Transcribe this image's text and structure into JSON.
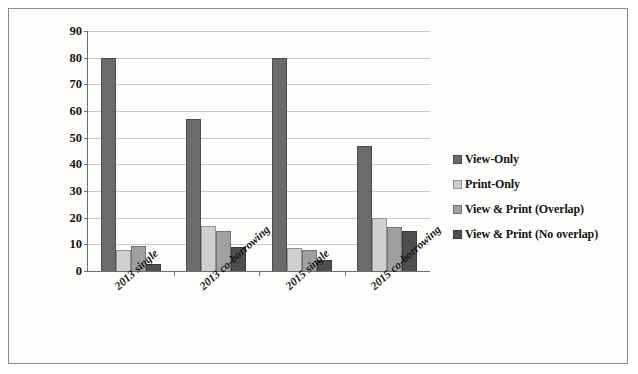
{
  "chart_data": {
    "type": "bar",
    "title": "",
    "xlabel": "",
    "ylabel": "Percentage of activity by loan type",
    "ylim": [
      0,
      90
    ],
    "ytick_step": 10,
    "yticks": [
      "90",
      "80",
      "70",
      "60",
      "50",
      "40",
      "30",
      "20",
      "10",
      "0"
    ],
    "grid": true,
    "legend_position": "right",
    "categories": [
      "2013 single",
      "2013 co-borrowing",
      "2015 single",
      "2015 co-borrowing"
    ],
    "series": [
      {
        "name": "View-Only",
        "color": "#6b6b6b",
        "values": [
          80,
          57,
          80,
          47
        ]
      },
      {
        "name": "Print-Only",
        "color": "#cfcfcf",
        "values": [
          8,
          17,
          8.5,
          20
        ]
      },
      {
        "name": "View & Print (Overlap)",
        "color": "#a0a0a0",
        "values": [
          9.5,
          15,
          8,
          16.5
        ]
      },
      {
        "name": "View & Print (No overlap)",
        "color": "#4f4f4f",
        "values": [
          2.5,
          9,
          4,
          15
        ]
      }
    ]
  },
  "colors": {
    "axis": "#6d6d6d",
    "gridline": "#c9c9c9",
    "frame": "#8a8a8a",
    "background": "#fdfdfc",
    "text": "#131313"
  }
}
